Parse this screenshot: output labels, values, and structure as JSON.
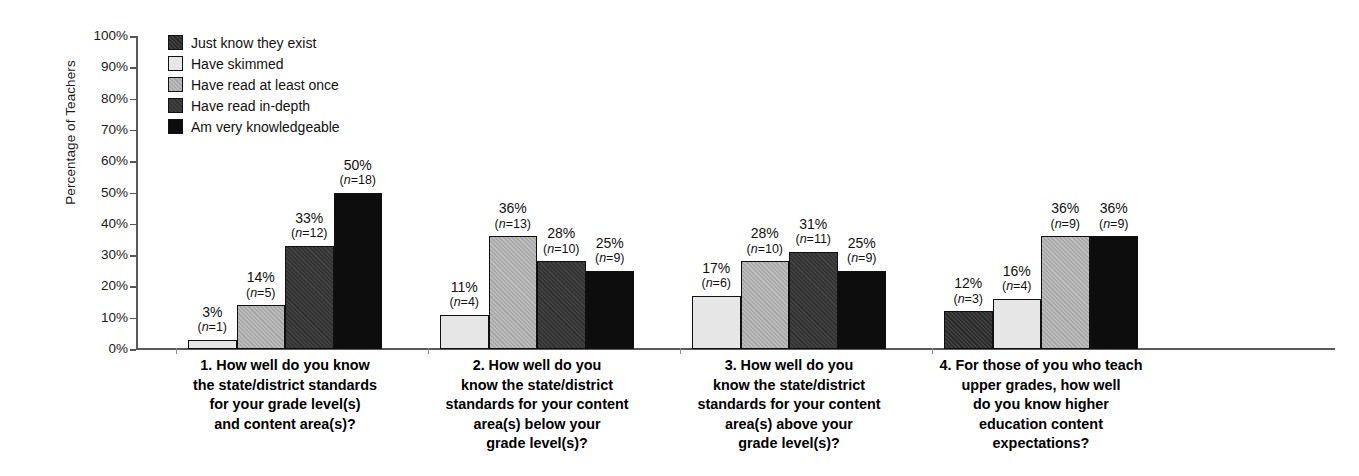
{
  "chart_data": {
    "type": "bar",
    "title": "",
    "subtitle": "",
    "xlabel": "",
    "ylabel": "Percentage of Teachers",
    "ylim": [
      0,
      100
    ],
    "grid": false,
    "legend_position": "top-left inside plot",
    "y_ticks": [
      "0%",
      "10%",
      "20%",
      "30%",
      "40%",
      "50%",
      "60%",
      "70%",
      "80%",
      "90%",
      "100%"
    ],
    "series": [
      {
        "name": "Just know they exist",
        "color": "#2b2b2b",
        "texture": "dark-speckled"
      },
      {
        "name": "Have skimmed",
        "color": "#e6e6e6",
        "texture": "light"
      },
      {
        "name": "Have read at least once",
        "color": "#a8a8a8",
        "texture": "medium-speckled"
      },
      {
        "name": "Have read in-depth",
        "color": "#333333",
        "texture": "dark-speckled"
      },
      {
        "name": "Am very knowledgeable",
        "color": "#0d0d0d",
        "texture": "solid-black"
      }
    ],
    "categories": [
      "1. How well do you know the state/district standards for your grade level(s) and content area(s)?",
      "2. How well do you know the state/district standards for your content area(s) below your grade level(s)?",
      "3. How well do you know the state/district standards for your content area(s) above your grade level(s)?",
      "4. For those of you who teach upper grades, how well do you know higher education content expectations?"
    ],
    "groups": [
      {
        "caption_lines": [
          "1. How well do you know",
          "the state/district standards",
          "for your grade level(s)",
          "and content area(s)?"
        ],
        "bars": [
          {
            "series": "Have skimmed",
            "percent": 3,
            "percent_label": "3%",
            "n": 1,
            "n_label": "(n=1)"
          },
          {
            "series": "Have read at least once",
            "percent": 14,
            "percent_label": "14%",
            "n": 5,
            "n_label": "(n=5)"
          },
          {
            "series": "Have read in-depth",
            "percent": 33,
            "percent_label": "33%",
            "n": 12,
            "n_label": "(n=12)"
          },
          {
            "series": "Am very knowledgeable",
            "percent": 50,
            "percent_label": "50%",
            "n": 18,
            "n_label": "(n=18)"
          }
        ]
      },
      {
        "caption_lines": [
          "2. How well do you",
          "know the state/district",
          "standards for your content",
          "area(s) below your",
          "grade level(s)?"
        ],
        "bars": [
          {
            "series": "Have skimmed",
            "percent": 11,
            "percent_label": "11%",
            "n": 4,
            "n_label": "(n=4)"
          },
          {
            "series": "Have read at least once",
            "percent": 36,
            "percent_label": "36%",
            "n": 13,
            "n_label": "(n=13)"
          },
          {
            "series": "Have read in-depth",
            "percent": 28,
            "percent_label": "28%",
            "n": 10,
            "n_label": "(n=10)"
          },
          {
            "series": "Am very knowledgeable",
            "percent": 25,
            "percent_label": "25%",
            "n": 9,
            "n_label": "(n=9)"
          }
        ]
      },
      {
        "caption_lines": [
          "3. How well do you",
          "know the state/district",
          "standards for your content",
          "area(s) above your",
          "grade level(s)?"
        ],
        "bars": [
          {
            "series": "Have skimmed",
            "percent": 17,
            "percent_label": "17%",
            "n": 6,
            "n_label": "(n=6)"
          },
          {
            "series": "Have read at least once",
            "percent": 28,
            "percent_label": "28%",
            "n": 10,
            "n_label": "(n=10)"
          },
          {
            "series": "Have read in-depth",
            "percent": 31,
            "percent_label": "31%",
            "n": 11,
            "n_label": "(n=11)"
          },
          {
            "series": "Am very knowledgeable",
            "percent": 25,
            "percent_label": "25%",
            "n": 9,
            "n_label": "(n=9)"
          }
        ]
      },
      {
        "caption_lines": [
          "4. For those of you who teach",
          "upper grades, how well",
          "do you know higher",
          "education content",
          "expectations?"
        ],
        "bars": [
          {
            "series": "Just know they exist",
            "percent": 12,
            "percent_label": "12%",
            "n": 3,
            "n_label": "(n=3)"
          },
          {
            "series": "Have skimmed",
            "percent": 16,
            "percent_label": "16%",
            "n": 4,
            "n_label": "(n=4)"
          },
          {
            "series": "Have read at least once",
            "percent": 36,
            "percent_label": "36%",
            "n": 9,
            "n_label": "(n=9)"
          },
          {
            "series": "Am very knowledgeable",
            "percent": 36,
            "percent_label": "36%",
            "n": 9,
            "n_label": "(n=9)"
          }
        ]
      }
    ]
  },
  "legend": {
    "items": [
      {
        "label": "Just know they exist",
        "color": "#2b2b2b"
      },
      {
        "label": "Have skimmed",
        "color": "#f2f2f2"
      },
      {
        "label": "Have read at least once",
        "color": "#9c9c9c"
      },
      {
        "label": "Have read in-depth",
        "color": "#333333"
      },
      {
        "label": "Am very knowledgeable",
        "color": "#0d0d0d"
      }
    ]
  },
  "axes": {
    "y_title": "Percentage of Teachers"
  }
}
